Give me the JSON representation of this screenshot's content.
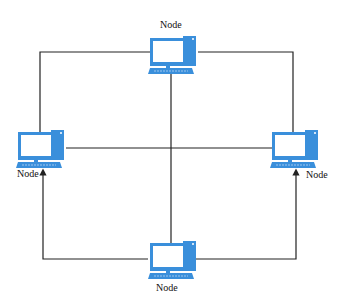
{
  "diagram": {
    "type": "network-topology",
    "colors": {
      "device": "#3a8fdb",
      "screen": "#ffffff",
      "line": "#222222"
    },
    "nodes": [
      {
        "id": "top",
        "label": "Node",
        "icon": "desktop-computer-icon"
      },
      {
        "id": "left",
        "label": "Node",
        "icon": "desktop-computer-icon"
      },
      {
        "id": "right",
        "label": "Node",
        "icon": "desktop-computer-icon"
      },
      {
        "id": "bottom",
        "label": "Node",
        "icon": "desktop-computer-icon"
      }
    ],
    "links": [
      {
        "from": "top",
        "to": "left"
      },
      {
        "from": "top",
        "to": "right"
      },
      {
        "from": "top",
        "to": "bottom"
      },
      {
        "from": "left",
        "to": "right"
      },
      {
        "from": "bottom",
        "to": "left",
        "arrow": true
      },
      {
        "from": "bottom",
        "to": "right",
        "arrow": true
      }
    ]
  }
}
